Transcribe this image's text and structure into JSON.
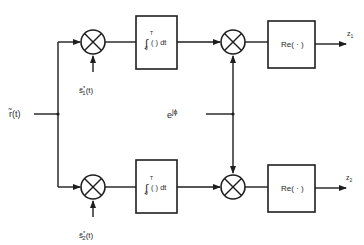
{
  "diagram": {
    "type": "block-diagram",
    "input": {
      "label": "r̃(t)"
    },
    "phase_input": {
      "label": "e",
      "superscript": "jϕ"
    },
    "branches": [
      {
        "id": "upper",
        "reference_signal": {
          "label": "s̃",
          "sup": "*",
          "sub": "1",
          "suffix": "(t)"
        },
        "multiplier_1": {
          "symbol": "⊗"
        },
        "integrator": {
          "integral": "∫",
          "upper": "T",
          "lower": "0",
          "body": "( ) dt"
        },
        "multiplier_2": {
          "symbol": "⊗"
        },
        "real_part_block": {
          "label": "Re( · )"
        },
        "output": {
          "label": "z",
          "sub": "1"
        }
      },
      {
        "id": "lower",
        "reference_signal": {
          "label": "s̃",
          "sup": "*",
          "sub": "2",
          "suffix": "(t)"
        },
        "multiplier_1": {
          "symbol": "⊗"
        },
        "integrator": {
          "integral": "∫",
          "upper": "T",
          "lower": "0",
          "body": "( ) dt"
        },
        "multiplier_2": {
          "symbol": "⊗"
        },
        "real_part_block": {
          "label": "Re( · )"
        },
        "output": {
          "label": "z",
          "sub": "2"
        }
      }
    ]
  }
}
